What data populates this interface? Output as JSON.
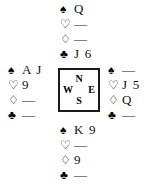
{
  "diagram": {
    "type": "bridge-hand-diagram",
    "suits": [
      {
        "key": "spades",
        "symbol": "♠",
        "name": "spade-symbol"
      },
      {
        "key": "hearts",
        "symbol": "♡",
        "name": "heart-symbol"
      },
      {
        "key": "diamonds",
        "symbol": "♢",
        "name": "diamond-symbol"
      },
      {
        "key": "clubs",
        "symbol": "♣",
        "name": "club-symbol"
      }
    ],
    "void_marker": "—",
    "hands": {
      "north": {
        "label": "North",
        "spades": "Q",
        "hearts": "—",
        "diamonds": "—",
        "clubs": "J 6"
      },
      "west": {
        "label": "West",
        "spades": "A J",
        "hearts": "9",
        "diamonds": "—",
        "clubs": "—"
      },
      "east": {
        "label": "East",
        "spades": "—",
        "hearts": "J 5",
        "diamonds": "Q",
        "clubs": "—"
      },
      "south": {
        "label": "South",
        "spades": "K 9",
        "hearts": "—",
        "diamonds": "9",
        "clubs": "—"
      }
    },
    "compass": {
      "north": "N",
      "east": "E",
      "south": "S",
      "west": "W"
    },
    "colors": {
      "ink": "#111111",
      "background": "#ffffff",
      "border": "#1a1a1a"
    }
  }
}
